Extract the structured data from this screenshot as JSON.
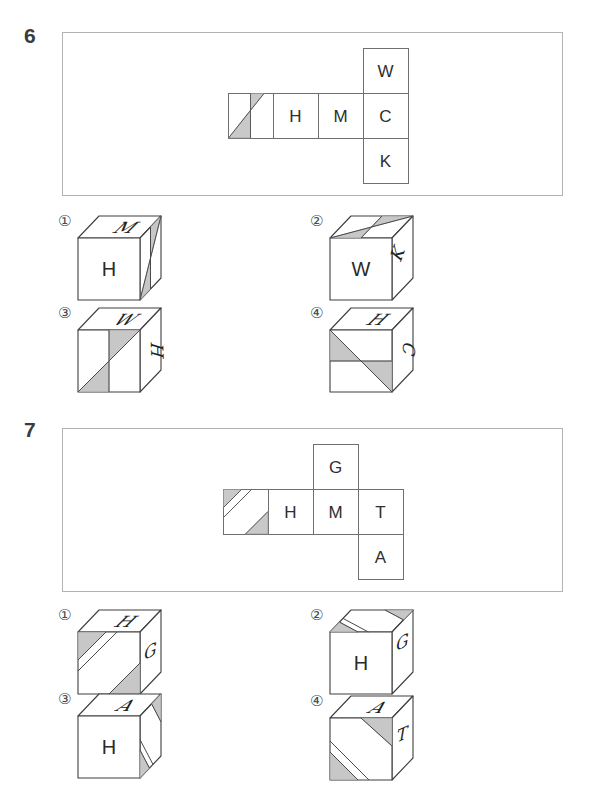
{
  "questions": [
    {
      "number": "6",
      "net": {
        "description": "cube net: patterned square, H, M, C in a row; W above C; K below C",
        "letters": {
          "a": "H",
          "b": "M",
          "c": "C",
          "top": "W",
          "bottom": "K"
        },
        "pattern": "diagonal with two gray triangles and vertical midline, first square of row"
      },
      "options": [
        {
          "label": "①",
          "faces": {
            "top": "M",
            "front": "H",
            "right": ""
          },
          "pattern_face": "right"
        },
        {
          "label": "②",
          "faces": {
            "top": "",
            "front": "W",
            "right": "K"
          },
          "pattern_face": "top"
        },
        {
          "label": "③",
          "faces": {
            "top": "W",
            "front": "",
            "right": "H"
          },
          "pattern_face": "front"
        },
        {
          "label": "④",
          "faces": {
            "top": "H",
            "front": "",
            "right": "C"
          },
          "pattern_face": "front"
        }
      ]
    },
    {
      "number": "7",
      "net": {
        "description": "cube net: patterned square, H, M, T in a row; G above M; A below T",
        "letters": {
          "a": "H",
          "b": "M",
          "c": "T",
          "top": "G",
          "bottom": "A"
        },
        "pattern": "gray corner triangles top-left and bottom-right with extra diagonal line, first square of row"
      },
      "options": [
        {
          "label": "①",
          "faces": {
            "top": "H",
            "front": "",
            "right": "G"
          },
          "pattern_face": "front"
        },
        {
          "label": "②",
          "faces": {
            "top": "",
            "front": "H",
            "right": "G"
          },
          "pattern_face": "top"
        },
        {
          "label": "③",
          "faces": {
            "top": "A",
            "front": "H",
            "right": ""
          },
          "pattern_face": "right"
        },
        {
          "label": "④",
          "faces": {
            "top": "A",
            "front": "",
            "right": "T"
          },
          "pattern_face": "front"
        }
      ]
    }
  ],
  "colors": {
    "shade": "#c7c7c7",
    "line": "#3f3f3f",
    "box_border": "#b3b3b3",
    "text": "#2e2e2e"
  }
}
